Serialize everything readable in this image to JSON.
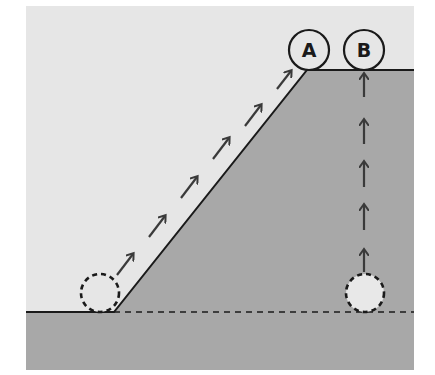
{
  "diagram": {
    "colors": {
      "sky": "#e6e6e6",
      "ground": "#a8a8a8",
      "line": "#1a1a1a",
      "arrow": "#3a3a3a",
      "ball_fill": "#e8e8e8"
    },
    "labels": {
      "a": "A",
      "b": "B"
    },
    "path_a": {
      "description": "Ball rolls up inclined slope from start position to A",
      "arrow_count": 6
    },
    "path_b": {
      "description": "Ball lifted vertically from start position to B",
      "arrow_count": 5
    }
  }
}
